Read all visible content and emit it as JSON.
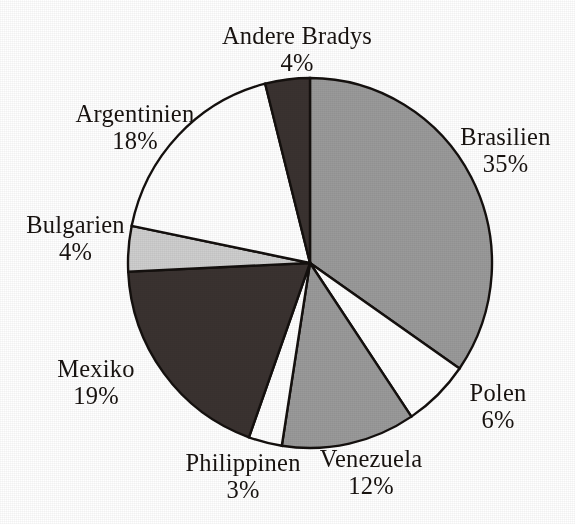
{
  "chart_data": {
    "type": "pie",
    "title": "",
    "subtitle": "",
    "xlabel": "",
    "ylabel": "",
    "legend_position": "none",
    "grid": false,
    "units": "%",
    "label_format": "{name}\n{value}%",
    "start_angle_deg": 0,
    "direction": "clockwise",
    "total": 101,
    "categories": [
      "Brasilien",
      "Polen",
      "Venezuela",
      "Philippinen",
      "Mexiko",
      "Bulgarien",
      "Argentinien",
      "Andere Bradys"
    ],
    "values": [
      35,
      6,
      12,
      3,
      19,
      4,
      18,
      4
    ],
    "slices": [
      {
        "key": "brasilien",
        "name": "Brasilien",
        "value": 35,
        "value_label": "35%",
        "color": "#9a9a9a",
        "fill_name": "medium-gray",
        "start_deg": 0,
        "end_deg": 124.75
      },
      {
        "key": "polen",
        "name": "Polen",
        "value": 6,
        "value_label": "6%",
        "color": "#ffffff",
        "fill_name": "white",
        "start_deg": 124.75,
        "end_deg": 146.14
      },
      {
        "key": "venezuela",
        "name": "Venezuela",
        "value": 12,
        "value_label": "12%",
        "color": "#9a9a9a",
        "fill_name": "medium-gray",
        "start_deg": 146.14,
        "end_deg": 188.91
      },
      {
        "key": "philippinen",
        "name": "Philippinen",
        "value": 3,
        "value_label": "3%",
        "color": "#ffffff",
        "fill_name": "white",
        "start_deg": 188.91,
        "end_deg": 199.6
      },
      {
        "key": "mexiko",
        "name": "Mexiko",
        "value": 19,
        "value_label": "19%",
        "color": "#3a3230",
        "fill_name": "near-black",
        "start_deg": 199.6,
        "end_deg": 267.33
      },
      {
        "key": "bulgarien",
        "name": "Bulgarien",
        "value": 4,
        "value_label": "4%",
        "color": "#cecece",
        "fill_name": "light-gray",
        "start_deg": 267.33,
        "end_deg": 281.58
      },
      {
        "key": "argentinien",
        "name": "Argentinien",
        "value": 18,
        "value_label": "18%",
        "color": "#ffffff",
        "fill_name": "white",
        "start_deg": 281.58,
        "end_deg": 345.74
      },
      {
        "key": "andere_bradys",
        "name": "Andere Bradys",
        "value": 4,
        "value_label": "4%",
        "color": "#3a3230",
        "fill_name": "near-black",
        "start_deg": 345.74,
        "end_deg": 360
      }
    ]
  },
  "labels": {
    "andere_bradys": {
      "name": "Andere Bradys",
      "value": "4%"
    },
    "brasilien": {
      "name": "Brasilien",
      "value": "35%"
    },
    "polen": {
      "name": "Polen",
      "value": "6%"
    },
    "venezuela": {
      "name": "Venezuela",
      "value": "12%"
    },
    "philippinen": {
      "name": "Philippinen",
      "value": "3%"
    },
    "mexiko": {
      "name": "Mexiko",
      "value": "19%"
    },
    "bulgarien": {
      "name": "Bulgarien",
      "value": "4%"
    },
    "argentinien": {
      "name": "Argentinien",
      "value": "18%"
    }
  },
  "geometry": {
    "center_x": 310,
    "center_y": 263,
    "radius_x": 182,
    "radius_y": 185,
    "outline_color": "#14100e",
    "background": "#ffffff"
  }
}
